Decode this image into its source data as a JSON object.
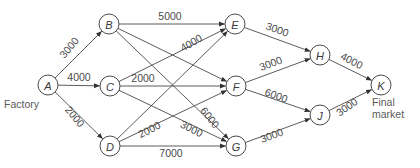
{
  "diagram": {
    "type": "network-flow",
    "colors": {
      "stroke": "#4a4a4a",
      "text": "#4a4a4a",
      "background": "#ffffff"
    },
    "node_radius": 10,
    "nodes": [
      {
        "id": "A",
        "label": "A",
        "x": 48,
        "y": 85
      },
      {
        "id": "B",
        "label": "B",
        "x": 109,
        "y": 24
      },
      {
        "id": "C",
        "label": "C",
        "x": 110,
        "y": 86
      },
      {
        "id": "D",
        "label": "D",
        "x": 110,
        "y": 146
      },
      {
        "id": "E",
        "label": "E",
        "x": 235,
        "y": 24
      },
      {
        "id": "F",
        "label": "F",
        "x": 236,
        "y": 86
      },
      {
        "id": "G",
        "label": "G",
        "x": 236,
        "y": 146
      },
      {
        "id": "H",
        "label": "H",
        "x": 320,
        "y": 55
      },
      {
        "id": "J",
        "label": "J",
        "x": 320,
        "y": 115
      },
      {
        "id": "K",
        "label": "K",
        "x": 381,
        "y": 85
      }
    ],
    "edges": [
      {
        "from": "A",
        "to": "B",
        "label": "3000",
        "lx": 72,
        "ly": 50,
        "rot": -50
      },
      {
        "from": "A",
        "to": "C",
        "label": "4000",
        "lx": 79,
        "ly": 81,
        "rot": 0
      },
      {
        "from": "A",
        "to": "D",
        "label": "2000",
        "lx": 72,
        "ly": 119,
        "rot": 50
      },
      {
        "from": "B",
        "to": "E",
        "label": "5000",
        "lx": 170,
        "ly": 20,
        "rot": 0
      },
      {
        "from": "B",
        "to": "F",
        "label": "",
        "lx": 0,
        "ly": 0,
        "rot": 0
      },
      {
        "from": "B",
        "to": "G",
        "label": "6000",
        "lx": 207,
        "ly": 120,
        "rot": 52
      },
      {
        "from": "C",
        "to": "E",
        "label": "4000",
        "lx": 193,
        "ly": 46,
        "rot": -30
      },
      {
        "from": "C",
        "to": "F",
        "label": "2000",
        "lx": 143,
        "ly": 82,
        "rot": 0
      },
      {
        "from": "C",
        "to": "G",
        "label": "3000",
        "lx": 190,
        "ly": 132,
        "rot": 27
      },
      {
        "from": "D",
        "to": "E",
        "label": "",
        "lx": 0,
        "ly": 0,
        "rot": 0
      },
      {
        "from": "D",
        "to": "F",
        "label": "2000",
        "lx": 151,
        "ly": 133,
        "rot": -27
      },
      {
        "from": "D",
        "to": "G",
        "label": "7000",
        "lx": 171,
        "ly": 157,
        "rot": 0
      },
      {
        "from": "E",
        "to": "H",
        "label": "3000",
        "lx": 276,
        "ly": 33,
        "rot": 20
      },
      {
        "from": "F",
        "to": "H",
        "label": "3000",
        "lx": 272,
        "ly": 67,
        "rot": -20
      },
      {
        "from": "F",
        "to": "J",
        "label": "6000",
        "lx": 275,
        "ly": 99,
        "rot": 20
      },
      {
        "from": "G",
        "to": "J",
        "label": "3000",
        "lx": 273,
        "ly": 139,
        "rot": -20
      },
      {
        "from": "H",
        "to": "K",
        "label": "4000",
        "lx": 350,
        "ly": 64,
        "rot": 28
      },
      {
        "from": "J",
        "to": "K",
        "label": "3000",
        "lx": 349,
        "ly": 110,
        "rot": -35
      }
    ],
    "captions": {
      "factory": "Factory",
      "final_line1": "Final",
      "final_line2": "market"
    }
  }
}
